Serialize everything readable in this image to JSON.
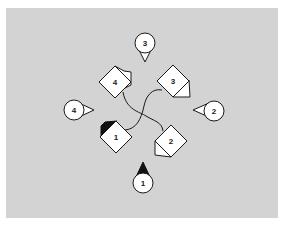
{
  "figure": {
    "background_color": "#ffffff",
    "panel_color": "#d3d3d3",
    "stroke_color": "#1a1a1a",
    "fill_color": "#ffffff",
    "accent_fill": "#111111"
  },
  "pieces": [
    {
      "id": "piece-1",
      "label": "1",
      "position": "bottom-left",
      "flap": "filled-black-top-left"
    },
    {
      "id": "piece-2",
      "label": "2",
      "position": "bottom-right",
      "flap": "triangle-bottom-left"
    },
    {
      "id": "piece-3",
      "label": "3",
      "position": "top-right",
      "flap": "triangle-right"
    },
    {
      "id": "piece-4",
      "label": "4",
      "position": "top-left",
      "flap": "pentagon-top-right"
    }
  ],
  "markers": [
    {
      "id": "marker-1",
      "label": "1",
      "position": "bottom",
      "pointer": "up",
      "pointer_filled": true
    },
    {
      "id": "marker-2",
      "label": "2",
      "position": "right",
      "pointer": "left",
      "pointer_filled": false
    },
    {
      "id": "marker-3",
      "label": "3",
      "position": "top",
      "pointer": "down",
      "pointer_filled": false
    },
    {
      "id": "marker-4",
      "label": "4",
      "position": "left",
      "pointer": "right",
      "pointer_filled": false
    }
  ],
  "connectors": [
    {
      "from": "4",
      "to": "2"
    },
    {
      "from": "3",
      "to": "1"
    }
  ]
}
